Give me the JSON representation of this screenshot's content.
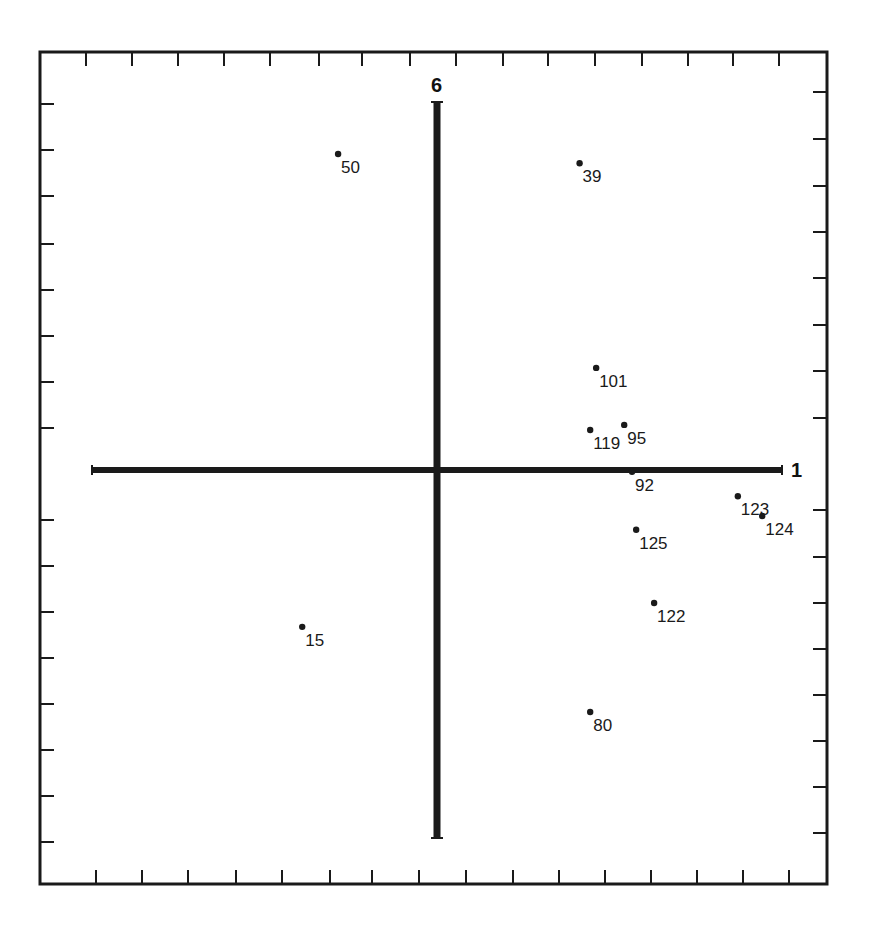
{
  "chart_data": {
    "type": "scatter",
    "title": "",
    "xlabel": "1",
    "ylabel": "6",
    "grid": false,
    "legend": null,
    "tick_spacing_units": 1,
    "xlim": [
      -7.5,
      7.5
    ],
    "ylim": [
      -8.0,
      8.5
    ],
    "axis_extent": {
      "x_axis": [
        -7.5,
        7.5
      ],
      "y_axis": [
        -8.0,
        8.0
      ]
    },
    "points": [
      {
        "label": "50",
        "x": -2.15,
        "y": 6.87
      },
      {
        "label": "39",
        "x": 3.1,
        "y": 6.67
      },
      {
        "label": "101",
        "x": 3.46,
        "y": 2.22
      },
      {
        "label": "119",
        "x": 3.33,
        "y": 0.87
      },
      {
        "label": "95",
        "x": 4.07,
        "y": 0.98
      },
      {
        "label": "92",
        "x": 4.24,
        "y": -0.04
      },
      {
        "label": "123",
        "x": 6.54,
        "y": -0.57
      },
      {
        "label": "124",
        "x": 7.07,
        "y": -1.0
      },
      {
        "label": "125",
        "x": 4.33,
        "y": -1.3
      },
      {
        "label": "122",
        "x": 4.72,
        "y": -2.89
      },
      {
        "label": "15",
        "x": -2.93,
        "y": -3.41
      },
      {
        "label": "80",
        "x": 3.33,
        "y": -5.26
      }
    ]
  },
  "render": {
    "origin_px": [
      437,
      470
    ],
    "unit_px": 46,
    "frame": {
      "x1": 40,
      "y1": 52,
      "x2": 827,
      "y2": 884
    },
    "top_ticks": [
      86,
      132,
      178,
      224,
      270,
      319,
      362,
      410,
      456,
      503,
      548,
      595,
      642,
      688,
      733,
      779
    ],
    "bottom_ticks": [
      96,
      142,
      188,
      236,
      282,
      330,
      372,
      419,
      466,
      513,
      559,
      605,
      651,
      697,
      743,
      789
    ],
    "left_ticks": [
      104,
      150,
      196,
      244,
      290,
      336,
      382,
      428,
      520,
      566,
      612,
      658,
      704,
      750,
      796,
      842
    ],
    "right_ticks": [
      92,
      139,
      186,
      232,
      278,
      325,
      371,
      418,
      510,
      557,
      603,
      649,
      695,
      741,
      787,
      833
    ],
    "colors": {
      "ink": "#1a1a1a",
      "background": "#ffffff"
    }
  }
}
